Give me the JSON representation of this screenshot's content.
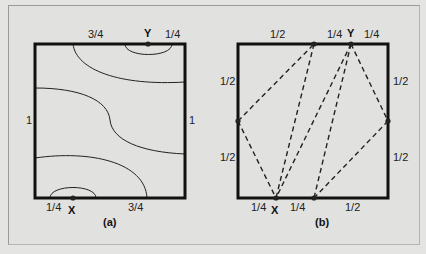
{
  "figure": {
    "panel_a": {
      "caption": "(a)",
      "labels": {
        "top_left": "3/4",
        "top_right": "1/4",
        "left": "1",
        "right": "1",
        "bottom_left": "1/4",
        "bottom_right": "3/4"
      },
      "points": {
        "top": "Y",
        "bottom": "X"
      }
    },
    "panel_b": {
      "caption": "(b)",
      "labels": {
        "top_1": "1/2",
        "top_2": "1/4",
        "top_3": "1/4",
        "left_top": "1/2",
        "left_bottom": "1/2",
        "right_top": "1/2",
        "right_bottom": "1/2",
        "bottom_1": "1/4",
        "bottom_2": "1/4",
        "bottom_3": "1/2"
      },
      "points": {
        "top": "Y",
        "bottom": "X"
      }
    },
    "colors": {
      "background": "#e1e1df",
      "stroke": "#111111"
    }
  }
}
